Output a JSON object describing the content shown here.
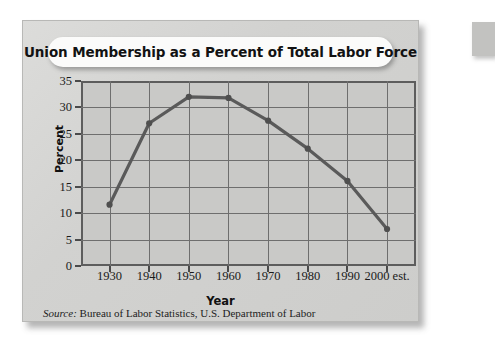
{
  "figure": {
    "title": "Union Membership as a Percent of Total Labor Force",
    "source_lead": "Source:",
    "source_text": " Bureau of Labor Statistics, U.S. Department of Labor"
  },
  "chart_data": {
    "type": "line",
    "title": "Union Membership as a Percent of Total Labor Force",
    "xlabel": "Year",
    "ylabel": "Percent",
    "categories": [
      "1930",
      "1940",
      "1950",
      "1960",
      "1970",
      "1980",
      "1990",
      "2000 est."
    ],
    "x_tick_labels": [
      "1930",
      "1940",
      "1950",
      "1960",
      "1970",
      "1980",
      "1990",
      "2000 est."
    ],
    "y_tick_labels": [
      "0",
      "5",
      "10",
      "15",
      "20",
      "25",
      "30",
      "35"
    ],
    "y_ticks": [
      0,
      5,
      10,
      15,
      20,
      25,
      30,
      35
    ],
    "values": [
      11.6,
      27.0,
      32.0,
      31.8,
      27.5,
      22.2,
      16.1,
      7.0
    ],
    "ylim": [
      0,
      35
    ],
    "grid": true,
    "legend": false,
    "series_color": "#5a5a5a",
    "plot_background": "#c9c9c7",
    "card_background": "#d2d2d0"
  }
}
